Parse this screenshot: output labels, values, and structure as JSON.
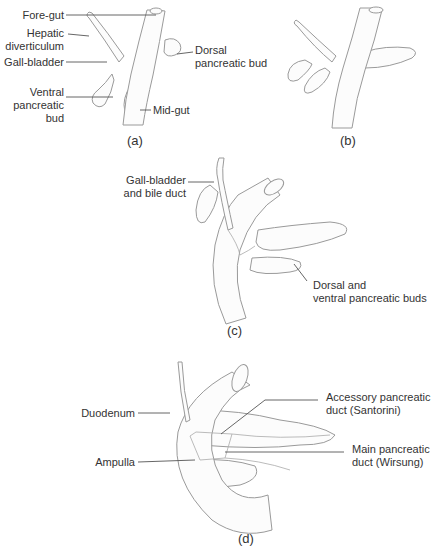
{
  "panels": {
    "a": {
      "caption": "(a)",
      "labels": {
        "fore_gut": "Fore-gut",
        "hepatic_1": "Hepatic",
        "hepatic_2": "diverticulum",
        "gall_bladder": "Gall-bladder",
        "dorsal_1": "Dorsal",
        "dorsal_2": "pancreatic bud",
        "ventral_1": "Ventral",
        "ventral_2": "pancreatic",
        "ventral_3": "bud",
        "mid_gut": "Mid-gut"
      }
    },
    "b": {
      "caption": "(b)"
    },
    "c": {
      "caption": "(c)",
      "labels": {
        "gb_1": "Gall-bladder",
        "gb_2": "and bile duct",
        "buds_1": "Dorsal and",
        "buds_2": "ventral pancreatic buds"
      }
    },
    "d": {
      "caption": "(d)",
      "labels": {
        "duodenum": "Duodenum",
        "ampulla": "Ampulla",
        "accessory_1": "Accessory pancreatic",
        "accessory_2": "duct (Santorini)",
        "main_1": "Main pancreatic",
        "main_2": "duct (Wirsung)"
      }
    }
  },
  "colors": {
    "outline": "#9a9a9a",
    "leader": "#555555",
    "text": "#333333",
    "fill": "#fcfcfc"
  }
}
